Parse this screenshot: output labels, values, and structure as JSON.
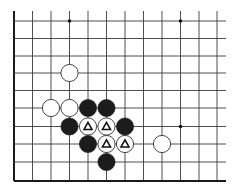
{
  "board": {
    "columns_x": [
      14,
      32.5,
      51,
      69.5,
      88,
      106.5,
      125,
      143.5,
      162,
      180.5,
      199,
      217
    ],
    "rows_y": [
      21,
      38.5,
      56,
      73,
      90.5,
      108,
      126.5,
      144,
      162,
      181
    ],
    "line_top": 11,
    "line_right": 226,
    "left_edge": true,
    "bottom_edge": true,
    "line_color": "#3a3a3a",
    "stone_radius": 8.6
  },
  "star_points": [
    {
      "col": 3,
      "row": 0
    },
    {
      "col": 9,
      "row": 0
    },
    {
      "col": 9,
      "row": 6
    }
  ],
  "stones": [
    {
      "color": "white",
      "col": 3,
      "row": 3,
      "marker": ""
    },
    {
      "color": "white",
      "col": 2,
      "row": 5,
      "marker": ""
    },
    {
      "color": "white",
      "col": 3,
      "row": 5,
      "marker": ""
    },
    {
      "color": "black",
      "col": 4,
      "row": 5,
      "marker": ""
    },
    {
      "color": "black",
      "col": 5,
      "row": 5,
      "marker": ""
    },
    {
      "color": "black",
      "col": 3,
      "row": 6,
      "marker": ""
    },
    {
      "color": "white",
      "col": 4,
      "row": 6,
      "marker": "triangle"
    },
    {
      "color": "white",
      "col": 5,
      "row": 6,
      "marker": "triangle"
    },
    {
      "color": "black",
      "col": 6,
      "row": 6,
      "marker": ""
    },
    {
      "color": "black",
      "col": 4,
      "row": 7,
      "marker": ""
    },
    {
      "color": "white",
      "col": 5,
      "row": 7,
      "marker": "triangle"
    },
    {
      "color": "white",
      "col": 6,
      "row": 7,
      "marker": "triangle"
    },
    {
      "color": "white",
      "col": 8,
      "row": 7,
      "marker": ""
    },
    {
      "color": "black",
      "col": 5,
      "row": 8,
      "marker": ""
    }
  ],
  "marker_legend": {
    "triangle": "marked stones (Δ)"
  }
}
